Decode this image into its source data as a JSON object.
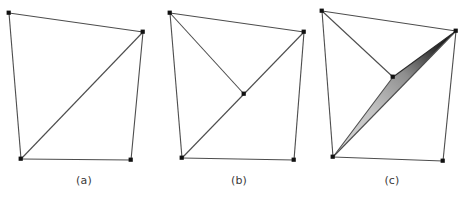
{
  "figure": {
    "background_color": "#ffffff",
    "width": 468,
    "height": 197,
    "edge_color": "#4d4d4d",
    "vertex_color": "#111111",
    "caption_color": "#3a3a3a",
    "sliver_fill_light": "#d0d0d0",
    "sliver_fill_dark": "#000000"
  },
  "panels": [
    {
      "id": "a",
      "caption": "(a)",
      "description": "Quadrilateral split into two triangles by one diagonal",
      "vertices": [
        {
          "name": "top-left",
          "x": 9,
          "y": 13
        },
        {
          "name": "top-right",
          "x": 143,
          "y": 32
        },
        {
          "name": "bottom-right",
          "x": 131,
          "y": 160
        },
        {
          "name": "bottom-left",
          "x": 21,
          "y": 159
        }
      ],
      "edges": [
        {
          "from": "top-left",
          "to": "top-right",
          "kind": "boundary"
        },
        {
          "from": "top-right",
          "to": "bottom-right",
          "kind": "boundary"
        },
        {
          "from": "bottom-right",
          "to": "bottom-left",
          "kind": "boundary"
        },
        {
          "from": "bottom-left",
          "to": "top-left",
          "kind": "boundary"
        },
        {
          "from": "bottom-left",
          "to": "top-right",
          "kind": "diagonal"
        }
      ],
      "shaded_triangles": []
    },
    {
      "id": "b",
      "caption": "(b)",
      "description": "Same quadrilateral with an interior Steiner point creating four triangles",
      "vertices": [
        {
          "name": "top-left",
          "x": 170,
          "y": 13
        },
        {
          "name": "top-right",
          "x": 304,
          "y": 32
        },
        {
          "name": "bottom-right",
          "x": 294,
          "y": 160
        },
        {
          "name": "bottom-left",
          "x": 182,
          "y": 158
        },
        {
          "name": "interior",
          "x": 244,
          "y": 94
        }
      ],
      "edges": [
        {
          "from": "top-left",
          "to": "top-right",
          "kind": "boundary"
        },
        {
          "from": "top-right",
          "to": "bottom-right",
          "kind": "boundary"
        },
        {
          "from": "bottom-right",
          "to": "bottom-left",
          "kind": "boundary"
        },
        {
          "from": "bottom-left",
          "to": "top-left",
          "kind": "boundary"
        },
        {
          "from": "bottom-left",
          "to": "top-right",
          "kind": "diagonal"
        },
        {
          "from": "top-left",
          "to": "interior",
          "kind": "interior"
        }
      ],
      "shaded_triangles": []
    },
    {
      "id": "c",
      "caption": "(c)",
      "description": "Interior point moved onto the diagonal producing a shaded sliver triangle",
      "vertices": [
        {
          "name": "top-left",
          "x": 322,
          "y": 11
        },
        {
          "name": "top-right",
          "x": 456,
          "y": 31
        },
        {
          "name": "bottom-right",
          "x": 443,
          "y": 161
        },
        {
          "name": "bottom-left",
          "x": 333,
          "y": 157
        },
        {
          "name": "interior",
          "x": 393,
          "y": 77
        }
      ],
      "edges": [
        {
          "from": "top-left",
          "to": "top-right",
          "kind": "boundary"
        },
        {
          "from": "top-right",
          "to": "bottom-right",
          "kind": "boundary"
        },
        {
          "from": "bottom-right",
          "to": "bottom-left",
          "kind": "boundary"
        },
        {
          "from": "bottom-left",
          "to": "top-left",
          "kind": "boundary"
        },
        {
          "from": "bottom-left",
          "to": "top-right",
          "kind": "diagonal"
        },
        {
          "from": "top-left",
          "to": "interior",
          "kind": "interior"
        },
        {
          "from": "bottom-left",
          "to": "interior",
          "kind": "sliver-edge"
        }
      ],
      "shaded_triangles": [
        {
          "name": "sliver",
          "points": "333,157 393,77 456,31",
          "fill": "gradient-light-to-dark"
        }
      ]
    }
  ]
}
